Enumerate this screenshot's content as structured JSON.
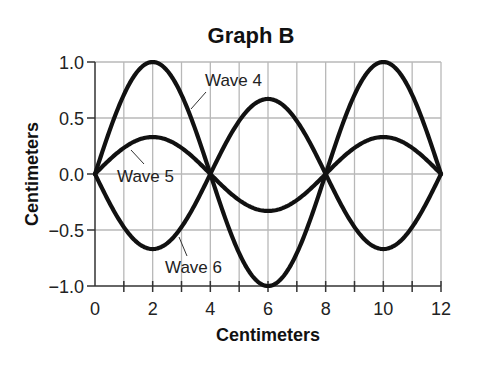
{
  "chart_data": {
    "type": "line",
    "title": "Graph B",
    "xlabel": "Centimeters",
    "ylabel": "Centimeters",
    "xlim": [
      0,
      12
    ],
    "ylim": [
      -1.0,
      1.0
    ],
    "x_ticks": [
      "0",
      "2",
      "4",
      "6",
      "8",
      "10",
      "12"
    ],
    "x_tick_values": [
      0,
      2,
      4,
      6,
      8,
      10,
      12
    ],
    "y_ticks": [
      "1.0",
      "0.5",
      "0.0",
      "−0.5",
      "−1.0"
    ],
    "y_tick_values": [
      1.0,
      0.5,
      0.0,
      -0.5,
      -1.0
    ],
    "grid": true,
    "legend": "inline labels with leader lines",
    "x": [
      0,
      2,
      4,
      6,
      8,
      10,
      12
    ],
    "series": [
      {
        "name": "Wave 4",
        "values": [
          0,
          1.0,
          0,
          -1.0,
          0,
          1.0,
          0
        ],
        "amplitude": 1.0
      },
      {
        "name": "Wave 5",
        "values": [
          0,
          0.33,
          0,
          -0.33,
          0,
          0.33,
          0
        ],
        "amplitude": 0.33
      },
      {
        "name": "Wave 6",
        "values": [
          0,
          -0.67,
          0,
          0.67,
          0,
          -0.67,
          0
        ],
        "amplitude": -0.67
      }
    ],
    "line_color": "#111111",
    "grid_color": "#b8b8b8"
  },
  "labels": {
    "title": "Graph B",
    "xlabel": "Centimeters",
    "ylabel": "Centimeters",
    "wave4": "Wave 4",
    "wave5": "Wave 5",
    "wave6": "Wave 6"
  }
}
